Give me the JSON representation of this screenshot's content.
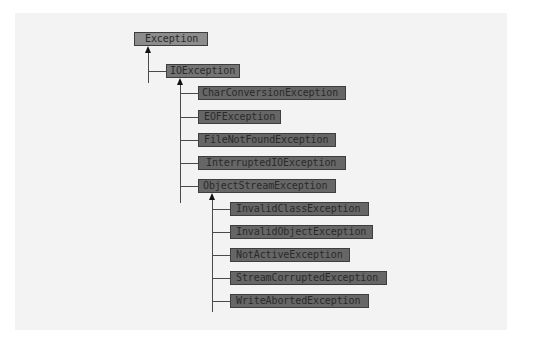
{
  "diagram": {
    "type": "class-hierarchy",
    "root": "Exception",
    "nodes": {
      "exception": "Exception",
      "ioexception": "IOException",
      "io_children": [
        "CharConversionException",
        "EOFException",
        "FileNotFoundException",
        "InterruptedIOException",
        "ObjectStreamException"
      ],
      "objectstream_children": [
        "InvalidClassException",
        "InvalidObjectException",
        "NotActiveException",
        "StreamCorruptedException",
        "WriteAbortedException"
      ]
    },
    "edges": [
      [
        "IOException",
        "Exception"
      ],
      [
        "CharConversionException",
        "IOException"
      ],
      [
        "EOFException",
        "IOException"
      ],
      [
        "FileNotFoundException",
        "IOException"
      ],
      [
        "InterruptedIOException",
        "IOException"
      ],
      [
        "ObjectStreamException",
        "IOException"
      ],
      [
        "InvalidClassException",
        "ObjectStreamException"
      ],
      [
        "InvalidObjectException",
        "ObjectStreamException"
      ],
      [
        "NotActiveException",
        "ObjectStreamException"
      ],
      [
        "StreamCorruptedException",
        "ObjectStreamException"
      ],
      [
        "WriteAbortedException",
        "ObjectStreamException"
      ]
    ],
    "colors": {
      "background": "#ffffff",
      "panel": "#f3f3f3",
      "root_fill": "#8c8c8c",
      "mid_fill": "#747474",
      "leaf_fill": "#666666",
      "border": "#3e3e3e",
      "text": "#2a2a2a",
      "line": "#4a4a4a"
    }
  }
}
